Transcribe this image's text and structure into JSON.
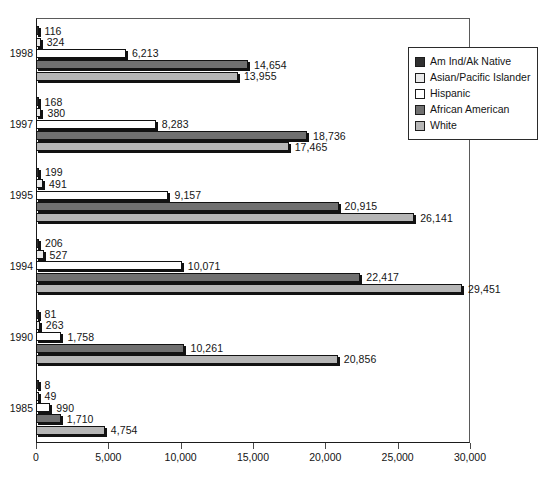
{
  "chart_data": {
    "type": "bar",
    "orientation": "horizontal",
    "title": "",
    "subtitle": "",
    "xlabel": "",
    "ylabel": "",
    "xlim": [
      0,
      30000
    ],
    "xticks": [
      "0",
      "5,000",
      "10,000",
      "15,000",
      "20,000",
      "25,000",
      "30,000"
    ],
    "xtick_values": [
      0,
      5000,
      10000,
      15000,
      20000,
      25000,
      30000
    ],
    "grid": false,
    "legend_position": "top-right",
    "categories": [
      "1998",
      "1997",
      "1995",
      "1994",
      "1990",
      "1985"
    ],
    "series": [
      {
        "name": "Am Ind/Ak Native",
        "color": "#2f2f2f",
        "values": [
          116,
          168,
          199,
          206,
          81,
          8
        ],
        "labels": [
          "116",
          "168",
          "199",
          "206",
          "81",
          "8"
        ]
      },
      {
        "name": "Asian/Pacific Islander",
        "color": "#eaeaea",
        "values": [
          324,
          380,
          491,
          527,
          263,
          49
        ],
        "labels": [
          "324",
          "380",
          "491",
          "527",
          "263",
          "49"
        ]
      },
      {
        "name": "Hispanic",
        "color": "#ffffff",
        "values": [
          6213,
          8283,
          9157,
          10071,
          1758,
          990
        ],
        "labels": [
          "6,213",
          "8,283",
          "9,157",
          "10,071",
          "1,758",
          "990"
        ]
      },
      {
        "name": "African American",
        "color": "#707070",
        "values": [
          14654,
          18736,
          20915,
          22417,
          10261,
          1710
        ],
        "labels": [
          "14,654",
          "18,736",
          "20,915",
          "22,417",
          "10,261",
          "1,710"
        ]
      },
      {
        "name": "White",
        "color": "#b6b6b6",
        "values": [
          13955,
          17465,
          26141,
          29451,
          20856,
          4754
        ],
        "labels": [
          "13,955",
          "17,465",
          "26,141",
          "29,451",
          "20,856",
          "4,754"
        ]
      }
    ]
  },
  "legend": {
    "items": [
      {
        "label": "Am Ind/Ak Native",
        "color": "#2f2f2f"
      },
      {
        "label": "Asian/Pacific Islander",
        "color": "#eaeaea"
      },
      {
        "label": "Hispanic",
        "color": "#ffffff"
      },
      {
        "label": "African American",
        "color": "#707070"
      },
      {
        "label": "White",
        "color": "#b6b6b6"
      }
    ]
  },
  "axis": {
    "x_tick_labels": [
      "0",
      "5,000",
      "10,000",
      "15,000",
      "20,000",
      "25,000",
      "30,000"
    ],
    "y_tick_labels": [
      "1998",
      "1997",
      "1995",
      "1994",
      "1990",
      "1985"
    ]
  }
}
